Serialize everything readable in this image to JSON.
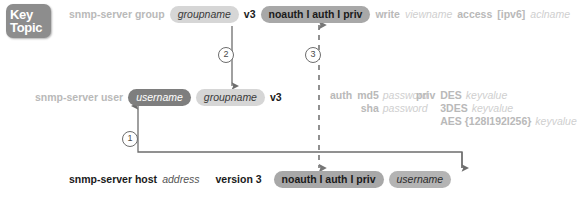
{
  "key_topic": {
    "line1": "Key",
    "line2": "Topic"
  },
  "rows": {
    "group": {
      "command": "snmp-server group",
      "groupname": "groupname",
      "version": "v3",
      "security_level": "noauth I auth I priv",
      "write_keyword": "write",
      "write_value": "viewname",
      "access_keyword": "access",
      "access_option": "[ipv6]",
      "access_value": "aclname"
    },
    "user": {
      "command": "snmp-server user",
      "username": "username",
      "groupname": "groupname",
      "version": "v3",
      "auth_keyword": "auth",
      "auth_algorithms": [
        {
          "name": "md5",
          "value": "password"
        },
        {
          "name": "sha",
          "value": "password"
        }
      ],
      "priv_keyword": "priv",
      "priv_algorithms": [
        {
          "name": "DES",
          "value": "keyvalue"
        },
        {
          "name": "3DES",
          "value": "keyvalue"
        },
        {
          "name": "AES {128I192I256}",
          "value": "keyvalue"
        }
      ]
    },
    "host": {
      "command": "snmp-server host",
      "address": "address",
      "version": "version 3",
      "security_level": "noauth I auth I priv",
      "username": "username"
    }
  },
  "markers": {
    "one": "1",
    "two": "2",
    "three": "3"
  },
  "colors": {
    "badge_light": "#d6d6d6",
    "badge_mid": "#a8a8a8",
    "badge_dark": "#7e7e7e",
    "text_light": "#b9b9b9",
    "text_dark": "#1a1a1a",
    "key_topic_bg": "#8d8d8d",
    "connector": "#6d6d6d"
  }
}
